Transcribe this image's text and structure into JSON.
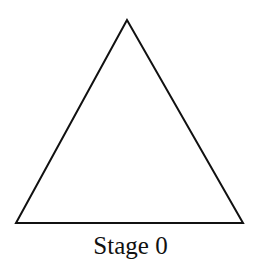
{
  "figure": {
    "caption": "Stage 0",
    "shape": "equilateral-triangle",
    "stroke_color": "#111111",
    "fill_color": "#ffffff"
  }
}
